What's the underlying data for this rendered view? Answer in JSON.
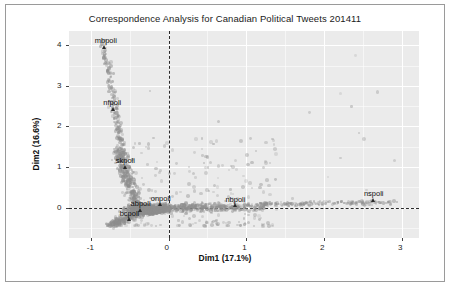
{
  "chart_data": {
    "type": "scatter",
    "title": "Correspondence Analysis for Canadian Political Tweets 201411",
    "xlabel": "Dim1 (17.1%)",
    "ylabel": "Dim2 (16.6%)",
    "xlim": [
      -1.28,
      3.22
    ],
    "ylim": [
      -0.75,
      4.35
    ],
    "xticks": [
      -1,
      0,
      1,
      2,
      3
    ],
    "xticklabels": [
      "-1",
      "0",
      "1",
      "2",
      "3"
    ],
    "yticks": [
      0,
      1,
      2,
      3,
      4
    ],
    "yticklabels": [
      "0",
      "1",
      "2",
      "3",
      "4"
    ],
    "grid": true,
    "grid_color": "#ffffff",
    "panel_background": "#ebebeb",
    "point_color": "#8e8e8e",
    "reference_lines": {
      "vertical_x": 0,
      "horizontal_y": 0,
      "style": "dashed",
      "color": "#2a2a2a"
    },
    "legend": "none",
    "labeled_points": [
      {
        "label": "mbpoli",
        "x": -0.82,
        "y": 3.95
      },
      {
        "label": "nfpoli",
        "x": -0.71,
        "y": 2.42
      },
      {
        "label": "skpoli",
        "x": -0.55,
        "y": 1.0
      },
      {
        "label": "onpoli",
        "x": -0.1,
        "y": 0.07
      },
      {
        "label": "abpoli",
        "x": -0.36,
        "y": -0.06
      },
      {
        "label": "bcpoli",
        "x": -0.5,
        "y": -0.3
      },
      {
        "label": "nbpoli",
        "x": 0.86,
        "y": 0.05
      },
      {
        "label": "nspoli",
        "x": 2.64,
        "y": 0.18
      }
    ],
    "cloud_description": "Dense grey point cloud of word positions concentrated near the origin, with a long arm extending up and to the left toward mbpoli and nfpoli, and a horizontal arm extending right along y=0 toward nbpoli and nspoli."
  }
}
